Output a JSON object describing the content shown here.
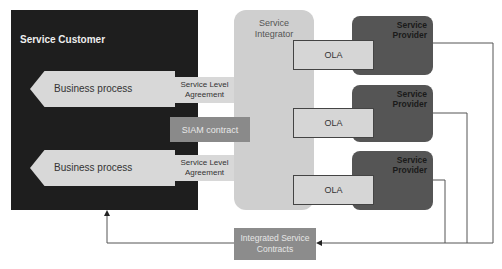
{
  "customer": {
    "title": "Service Customer"
  },
  "integrator": {
    "title_line1": "Service",
    "title_line2": "Integrator"
  },
  "business_processes": [
    {
      "label": "Business process",
      "sla_line1": "Service Level",
      "sla_line2": "Agreement"
    },
    {
      "label": "Business process",
      "sla_line1": "Service Level",
      "sla_line2": "Agreement"
    }
  ],
  "siam_contract": {
    "label": "SIAM contract"
  },
  "providers": [
    {
      "title_line1": "Service",
      "title_line2": "Provider",
      "ola": "OLA"
    },
    {
      "title_line1": "Service",
      "title_line2": "Provider",
      "ola": "OLA"
    },
    {
      "title_line1": "Service",
      "title_line2": "Provider",
      "ola": "OLA"
    }
  ],
  "integrated_contracts": {
    "line1": "Integrated Service",
    "line2": "Contracts"
  },
  "colors": {
    "customer": "#1e1e1e",
    "integrator": "#cfcfcf",
    "provider": "#555555",
    "ola": "#d6d6d6",
    "contract": "#8a8a8a"
  }
}
